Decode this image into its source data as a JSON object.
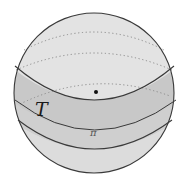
{
  "figure": {
    "labels": {
      "band": "T",
      "plane": "π"
    },
    "colors": {
      "sphere_fill": "#e1e1e1",
      "band_fill": "#c9c9c9",
      "lower_band_fill": "#d2d2d2",
      "outline": "#3a3a3a",
      "dotted": "#8a8a8a",
      "point": "#111111"
    }
  }
}
